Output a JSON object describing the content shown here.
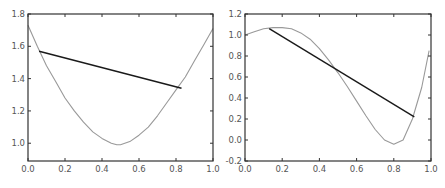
{
  "chart_data": [
    {
      "type": "line",
      "title": "",
      "xlabel": "",
      "ylabel": "",
      "xlim": [
        0.0,
        1.0
      ],
      "ylim": [
        0.89,
        1.8
      ],
      "grid": false,
      "x_ticks": [
        "0.0",
        "0.2",
        "0.4",
        "0.6",
        "0.8",
        "1.0"
      ],
      "y_ticks": [
        "1.0",
        "1.2",
        "1.4",
        "1.6",
        "1.8"
      ],
      "series": [
        {
          "name": "curve",
          "color": "#999999",
          "x": [
            0.0,
            0.05,
            0.1,
            0.15,
            0.2,
            0.25,
            0.3,
            0.35,
            0.4,
            0.45,
            0.48,
            0.5,
            0.55,
            0.6,
            0.65,
            0.7,
            0.75,
            0.8,
            0.85,
            0.9,
            0.95,
            1.0
          ],
          "y": [
            1.73,
            1.6,
            1.48,
            1.38,
            1.28,
            1.2,
            1.13,
            1.07,
            1.03,
            1.0,
            0.99,
            0.99,
            1.01,
            1.05,
            1.1,
            1.17,
            1.25,
            1.33,
            1.41,
            1.51,
            1.61,
            1.71
          ]
        },
        {
          "name": "secant",
          "color": "#1a1a1a",
          "x": [
            0.06,
            0.83
          ],
          "y": [
            1.57,
            1.34
          ]
        }
      ]
    },
    {
      "type": "line",
      "title": "",
      "xlabel": "",
      "ylabel": "",
      "xlim": [
        0.0,
        1.0
      ],
      "ylim": [
        -0.2,
        1.2
      ],
      "grid": false,
      "x_ticks": [
        "0.0",
        "0.2",
        "0.4",
        "0.6",
        "0.8",
        "1.0"
      ],
      "y_ticks": [
        "-0.2",
        "0.0",
        "0.2",
        "0.4",
        "0.6",
        "0.8",
        "1.0",
        "1.2"
      ],
      "series": [
        {
          "name": "curve",
          "color": "#999999",
          "x": [
            0.0,
            0.05,
            0.1,
            0.15,
            0.2,
            0.25,
            0.3,
            0.35,
            0.4,
            0.45,
            0.5,
            0.55,
            0.6,
            0.65,
            0.7,
            0.75,
            0.8,
            0.85,
            0.9,
            0.95,
            0.99
          ],
          "y": [
            1.0,
            1.03,
            1.06,
            1.07,
            1.07,
            1.06,
            1.02,
            0.96,
            0.87,
            0.76,
            0.64,
            0.51,
            0.37,
            0.23,
            0.1,
            0.0,
            -0.04,
            0.0,
            0.2,
            0.5,
            0.85
          ]
        },
        {
          "name": "secant",
          "color": "#1a1a1a",
          "x": [
            0.13,
            0.91
          ],
          "y": [
            1.06,
            0.22
          ]
        }
      ]
    }
  ],
  "colors": {
    "axis": "#333333",
    "curve": "#999999",
    "secant": "#1a1a1a",
    "tick_label": "#555555"
  }
}
